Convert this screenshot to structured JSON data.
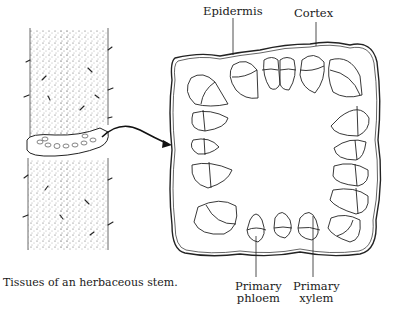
{
  "figure": {
    "caption": "Tissues of an herbaceous stem.",
    "labels": {
      "epidermis": "Epidermis",
      "cortex": "Cortex",
      "primary_phloem_line1": "Primary",
      "primary_phloem_line2": "phloem",
      "primary_xylem_line1": "Primary",
      "primary_xylem_line2": "xylem"
    }
  }
}
